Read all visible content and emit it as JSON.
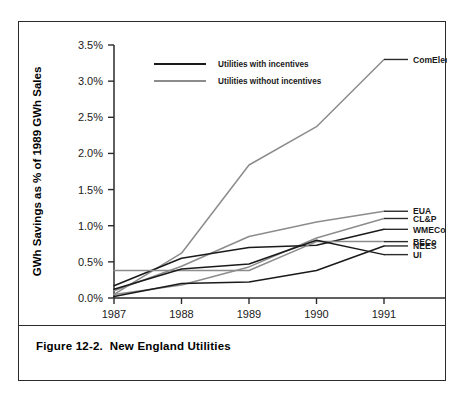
{
  "figure": {
    "caption": "Figure 12-2.  New England Utilities"
  },
  "chart_data": {
    "type": "line",
    "title": "",
    "xlabel": "Year",
    "ylabel": "GWh Savings as % of 1989 GWh Sales",
    "x": [
      1987,
      1988,
      1989,
      1990,
      1991
    ],
    "xticklabels": [
      "1987",
      "1988",
      "1989",
      "1990",
      "1991"
    ],
    "xlim": [
      1987,
      1991
    ],
    "ylim": [
      0.0,
      3.5
    ],
    "yticks": [
      0.0,
      0.5,
      1.0,
      1.5,
      2.0,
      2.5,
      3.0,
      3.5
    ],
    "yticklabels": [
      "0.0%",
      "0.5%",
      "1.0%",
      "1.5%",
      "2.0%",
      "2.5%",
      "3.0%",
      "3.5%"
    ],
    "grid": false,
    "legend_position": "top-left",
    "legend": [
      {
        "label": "Utilities with incentives",
        "color": "#1a1a1a"
      },
      {
        "label": "Utilities without incentives",
        "color": "#8c8c8c"
      }
    ],
    "series": [
      {
        "name": "ComElec",
        "group": "without incentives",
        "color": "#8c8c8c",
        "values": [
          0.05,
          0.62,
          1.84,
          2.37,
          3.3
        ],
        "label_y": 3.3
      },
      {
        "name": "EUA",
        "group": "without incentives",
        "color": "#8c8c8c",
        "values": [
          0.1,
          0.44,
          0.85,
          1.05,
          1.2
        ],
        "label_y": 1.2
      },
      {
        "name": "CL&P",
        "group": "without incentives",
        "color": "#8c8c8c",
        "values": [
          0.05,
          0.18,
          0.43,
          0.83,
          1.1
        ],
        "label_y": 1.1
      },
      {
        "name": "WMECo",
        "group": "with incentives",
        "color": "#1a1a1a",
        "values": [
          0.17,
          0.55,
          0.7,
          0.73,
          0.95
        ],
        "label_y": 0.95
      },
      {
        "name": "BECo",
        "group": "without incentives",
        "color": "#8c8c8c",
        "values": [
          0.38,
          0.38,
          0.38,
          0.78,
          0.78
        ],
        "label_y": 0.78
      },
      {
        "name": "UI",
        "group": "with incentives",
        "color": "#1a1a1a",
        "values": [
          0.12,
          0.4,
          0.47,
          0.8,
          0.6
        ],
        "label_y": 0.6
      },
      {
        "name": "NEES",
        "group": "with incentives",
        "color": "#1a1a1a",
        "values": [
          0.02,
          0.2,
          0.22,
          0.38,
          0.72
        ],
        "label_y": 0.72
      }
    ]
  }
}
